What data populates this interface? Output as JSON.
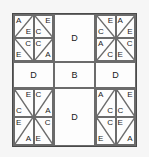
{
  "figure": {
    "type": "geometric-tiling-puzzle",
    "grid": {
      "rows": 3,
      "cols": 3
    },
    "background_color": "#f6f6f6",
    "board_color": "#fdfdfd",
    "line_color": "#6b6b6b",
    "border_color": "#4a4a4a",
    "text_color": "#1a1a1a"
  },
  "quadrants": {
    "top_left": {
      "name": "top-left-quadrant",
      "squares": [
        {
          "pos": "tl",
          "diagonal": "/",
          "upper_letter": "A",
          "lower_letter": "E"
        },
        {
          "pos": "tr",
          "diagonal": "\\",
          "upper_letter": "E",
          "lower_letter": "C"
        },
        {
          "pos": "bl",
          "diagonal": "\\",
          "upper_letter": "C",
          "lower_letter": "E"
        },
        {
          "pos": "br",
          "diagonal": "/",
          "upper_letter": "C",
          "lower_letter": "A"
        }
      ]
    },
    "top_right": {
      "name": "top-right-quadrant",
      "squares": [
        {
          "pos": "tl",
          "diagonal": "\\",
          "upper_letter": "E",
          "lower_letter": "C"
        },
        {
          "pos": "tr",
          "diagonal": "/",
          "upper_letter": "A",
          "lower_letter": "E"
        },
        {
          "pos": "bl",
          "diagonal": "/",
          "upper_letter": "A",
          "lower_letter": "C"
        },
        {
          "pos": "br",
          "diagonal": "\\",
          "upper_letter": "C",
          "lower_letter": "E"
        }
      ]
    },
    "bottom_left": {
      "name": "bottom-left-quadrant",
      "squares": [
        {
          "pos": "tl",
          "diagonal": "\\",
          "upper_letter": "E",
          "lower_letter": "C"
        },
        {
          "pos": "tr",
          "diagonal": "/",
          "upper_letter": "C",
          "lower_letter": "A"
        },
        {
          "pos": "bl",
          "diagonal": "/",
          "upper_letter": "E",
          "lower_letter": "A"
        },
        {
          "pos": "br",
          "diagonal": "\\",
          "upper_letter": "C",
          "lower_letter": "E"
        }
      ]
    },
    "bottom_right": {
      "name": "bottom-right-quadrant",
      "squares": [
        {
          "pos": "tl",
          "diagonal": "/",
          "upper_letter": "A",
          "lower_letter": "C"
        },
        {
          "pos": "tr",
          "diagonal": "\\",
          "upper_letter": "E",
          "lower_letter": "C"
        },
        {
          "pos": "bl",
          "diagonal": "\\",
          "upper_letter": "C",
          "lower_letter": "E"
        },
        {
          "pos": "br",
          "diagonal": "/",
          "upper_letter": "E",
          "lower_letter": "A"
        }
      ]
    }
  },
  "cross_cells": {
    "top_middle": "D",
    "middle_left": "D",
    "center": "B",
    "middle_right": "D",
    "bottom_middle": "D"
  }
}
